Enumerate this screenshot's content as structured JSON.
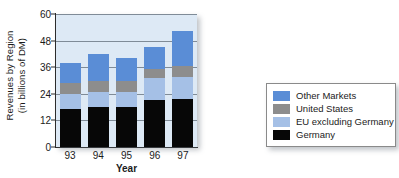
{
  "chart_data": {
    "type": "bar",
    "subtype": "stacked-vertical",
    "title": "",
    "xlabel": "Year",
    "ylabel": "Revenues by Region\n(in billions of DM)",
    "ylabel_line1": "Revenues by Region",
    "ylabel_line2": "(in billions of DM)",
    "categories": [
      "93",
      "94",
      "95",
      "96",
      "97"
    ],
    "ylim": [
      0,
      60
    ],
    "yticks": [
      0,
      12,
      24,
      36,
      48,
      60
    ],
    "ytick_labels": [
      "0",
      "12",
      "24",
      "36",
      "48",
      "60"
    ],
    "grid": true,
    "grid_axis": "y",
    "legend_position": "right",
    "stack_order_bottom_to_top": [
      "Germany",
      "EU excluding Germany",
      "United States",
      "Other Markets"
    ],
    "series": [
      {
        "name": "Germany",
        "color": "#070707",
        "values": [
          17.0,
          18.0,
          18.0,
          21.0,
          21.5
        ]
      },
      {
        "name": "EU excluding Germany",
        "color": "#a5c0e6",
        "values": [
          7.0,
          7.0,
          7.0,
          10.0,
          10.0
        ]
      },
      {
        "name": "United States",
        "color": "#8d8d8d",
        "values": [
          5.0,
          5.0,
          5.0,
          4.0,
          5.0
        ]
      },
      {
        "name": "Other Markets",
        "color": "#5a8dd6",
        "values": [
          9.0,
          12.0,
          10.0,
          10.0,
          16.0
        ]
      }
    ],
    "totals": [
      38.0,
      42.0,
      40.0,
      45.0,
      52.5
    ],
    "plot_background": "#dde9f5",
    "axis_color": "#2b2b2b",
    "gridline_color": "#7f8b97"
  },
  "legend": {
    "items": [
      {
        "label": "Other Markets",
        "color": "#5a8dd6"
      },
      {
        "label": "United States",
        "color": "#8d8d8d"
      },
      {
        "label": "EU excluding Germany",
        "color": "#a5c0e6"
      },
      {
        "label": "Germany",
        "color": "#070707"
      }
    ]
  }
}
